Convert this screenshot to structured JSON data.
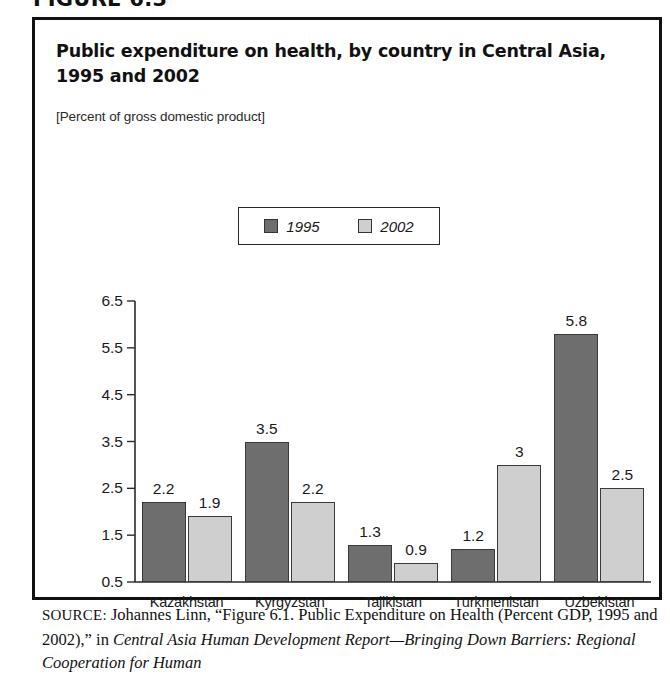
{
  "figure": {
    "number_label": "FIGURE 6.3",
    "title": "Public expenditure on health, by country in Central Asia, 1995 and 2002",
    "subtitle": "[Percent of gross domestic product]"
  },
  "legend": {
    "items": [
      {
        "label": "1995",
        "color": "#6e6e6e",
        "swatch_icon": "legend-swatch-dark"
      },
      {
        "label": "2002",
        "color": "#cfcfcf",
        "swatch_icon": "legend-swatch-light"
      }
    ]
  },
  "source": {
    "label": "SOURCE:",
    "line1_plain": " Johannes Linn, “Figure 6.1. Public Expenditure on Health",
    "line2_plain": "(Percent GDP, 1995 and 2002),” in ",
    "line2_italic": "Central Asia Human Development",
    "line3_italic": "Report—Bringing Down Barriers: Regional Cooperation for Human"
  },
  "chart_data": {
    "type": "bar",
    "title": "Public expenditure on health, by country in Central Asia, 1995 and 2002",
    "subtitle": "[Percent of gross domestic product]",
    "xlabel": "",
    "ylabel": "",
    "categories": [
      "Kazakhstan",
      "Kyrgyzstan",
      "Tajikistan",
      "Turkmenistan",
      "Uzbekistan"
    ],
    "series": [
      {
        "name": "1995",
        "color": "#6e6e6e",
        "values": [
          2.2,
          3.5,
          1.3,
          1.2,
          5.8
        ],
        "labels": [
          "2.2",
          "3.5",
          "1.3",
          "1.2",
          "5.8"
        ]
      },
      {
        "name": "2002",
        "color": "#cfcfcf",
        "values": [
          1.9,
          2.2,
          0.9,
          3.0,
          2.5
        ],
        "labels": [
          "1.9",
          "2.2",
          "0.9",
          "3",
          "2.5"
        ]
      }
    ],
    "ylim": [
      0.5,
      6.5
    ],
    "yticks": [
      0.5,
      1.5,
      2.5,
      3.5,
      4.5,
      5.5,
      6.5
    ],
    "ytick_labels": [
      "0.5",
      "1.5",
      "2.5",
      "3.5",
      "4.5",
      "5.5",
      "6.5"
    ],
    "grid": false,
    "legend_position": "top-center"
  }
}
